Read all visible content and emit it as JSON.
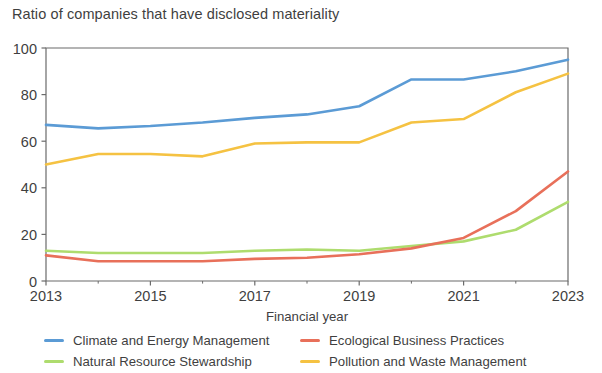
{
  "chart_data": {
    "type": "line",
    "title": "Ratio of companies that have disclosed materiality",
    "xlabel": "Financial year",
    "ylabel": "",
    "x": [
      2013,
      2014,
      2015,
      2016,
      2017,
      2018,
      2019,
      2020,
      2021,
      2022,
      2023
    ],
    "xlim": [
      2013,
      2023
    ],
    "ylim": [
      0,
      100
    ],
    "xticks": [
      2013,
      2015,
      2017,
      2019,
      2021,
      2023
    ],
    "xtick_labels": [
      "2013",
      "2015",
      "2017",
      "2019",
      "2021",
      "2023"
    ],
    "yticks": [
      0,
      20,
      40,
      60,
      80,
      100
    ],
    "ytick_labels": [
      "0",
      "20",
      "40",
      "60",
      "80",
      "100"
    ],
    "grid": false,
    "legend_position": "bottom",
    "series": [
      {
        "name": "Climate and Energy Management",
        "color": "#5B9BD5",
        "values": [
          67,
          65.5,
          66.5,
          68,
          70,
          71.5,
          75,
          86.5,
          86.5,
          90,
          95
        ]
      },
      {
        "name": "Ecological Business Practices",
        "color": "#E8705A",
        "values": [
          11,
          8.5,
          8.5,
          8.5,
          9.5,
          10,
          11.5,
          14,
          18.5,
          30,
          47
        ]
      },
      {
        "name": "Natural Resource Stewardship",
        "color": "#AEDC6E",
        "values": [
          13,
          12,
          12,
          12,
          13,
          13.5,
          13,
          15,
          17,
          22,
          34
        ]
      },
      {
        "name": "Pollution and Waste Management",
        "color": "#F5C242",
        "values": [
          50,
          54.5,
          54.5,
          53.5,
          59,
          59.5,
          59.5,
          68,
          69.5,
          81,
          89
        ]
      }
    ]
  },
  "legend": {
    "entries": [
      "Climate and Energy Management",
      "Ecological Business Practices",
      "Natural Resource Stewardship",
      "Pollution and Waste Management"
    ]
  },
  "axis": {
    "frame_color": "#6b6b6b"
  }
}
